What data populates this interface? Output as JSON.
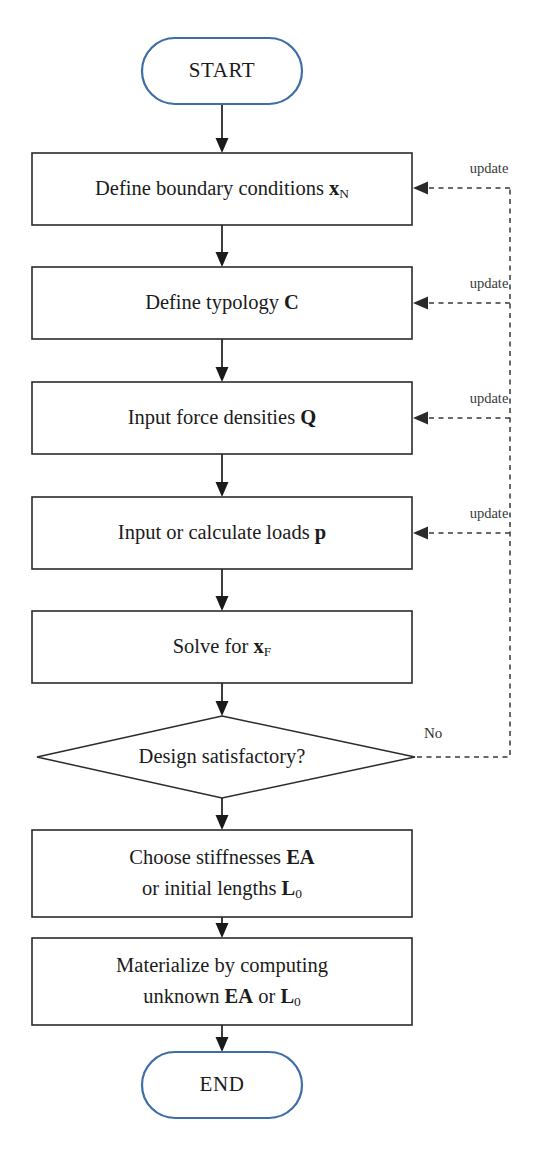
{
  "diagram": {
    "type": "flowchart",
    "colors": {
      "terminator_stroke": "#3e6da8",
      "node_stroke": "#2b2b2b",
      "connector": "#1a1a1a",
      "feedback_dashed": "#3a3a3a",
      "background": "#ffffff",
      "text": "#1b1b1b"
    },
    "nodes": [
      {
        "id": "start",
        "shape": "terminator",
        "label": "START"
      },
      {
        "id": "boundary-conditions",
        "shape": "process",
        "text_prefix": "Define boundary conditions ",
        "symbol": "x",
        "subscript": "N",
        "text_suffix": ""
      },
      {
        "id": "typology",
        "shape": "process",
        "text_prefix": "Define typology ",
        "symbol": "C",
        "subscript": "",
        "text_suffix": ""
      },
      {
        "id": "force-densities",
        "shape": "process",
        "text_prefix": "Input force densities ",
        "symbol": "Q",
        "subscript": "",
        "text_suffix": ""
      },
      {
        "id": "loads",
        "shape": "process",
        "text_prefix": "Input or calculate loads ",
        "symbol": "p",
        "subscript": "",
        "text_suffix": ""
      },
      {
        "id": "solve",
        "shape": "process",
        "text_prefix": "Solve for ",
        "symbol": "x",
        "subscript": "F",
        "text_suffix": ""
      },
      {
        "id": "decision",
        "shape": "decision",
        "label": "Design satisfactory?"
      },
      {
        "id": "stiffness",
        "shape": "process",
        "line1_prefix": "Choose stiffnesses ",
        "line1_symbol": "EA",
        "line2_prefix": "or initial lengths ",
        "line2_symbol": "L",
        "line2_subscript": "0"
      },
      {
        "id": "materialize",
        "shape": "process",
        "line1": "Materialize by computing",
        "line2_prefix": "unknown ",
        "line2_symbol_a": "EA",
        "line2_middle": " or ",
        "line2_symbol_b": "L",
        "line2_subscript": "0"
      },
      {
        "id": "end",
        "shape": "terminator",
        "label": "END"
      }
    ],
    "edge_labels": {
      "update_1": "update",
      "update_2": "update",
      "update_3": "update",
      "update_4": "update",
      "no_branch": "No"
    }
  }
}
